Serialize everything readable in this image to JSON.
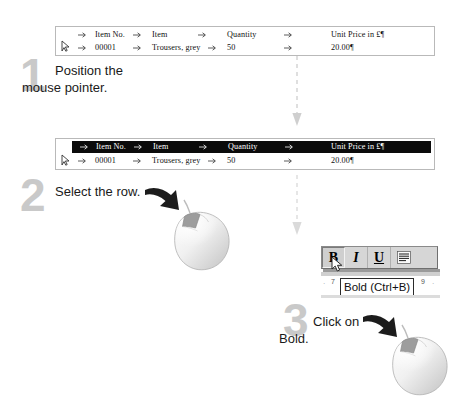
{
  "doc": {
    "title": "Bold a table row - three step instruction",
    "columns": [
      "Item No.",
      "Item",
      "Quantity",
      "Unit Price in £"
    ],
    "row_values": [
      "00001",
      "Trousers, grey",
      "50",
      "20.00"
    ],
    "pilcrow": "¶",
    "tab_icon": "tab-arrow-icon",
    "cursor_icon": "row-select-cursor-icon"
  },
  "steps": [
    {
      "number": "1",
      "text_line1": "Position the",
      "text_line2": "mouse pointer.",
      "state": "unselected"
    },
    {
      "number": "2",
      "text_line1": "Select the row.",
      "text_line2": "",
      "state": "header-row-selected"
    },
    {
      "number": "3",
      "text_line1": "Click on",
      "text_line2": "Bold.",
      "state": "click-bold"
    }
  ],
  "toolbar": {
    "bold_label": "B",
    "italic_label": "I",
    "underline_label": "U",
    "justify_label": "justify-icon",
    "bold_pressed": true
  },
  "tooltip": {
    "text": "Bold (Ctrl+B)"
  },
  "ruler": {
    "left_mark": "7",
    "right_mark": "9",
    "tick_left": "·",
    "tick_right": "·"
  },
  "connectors": [
    {
      "name": "step1-to-step2",
      "style": "dashed-down-arrow"
    },
    {
      "name": "step2-to-step3",
      "style": "dashed-down-arrow"
    }
  ],
  "mice": [
    {
      "name": "mouse-illustration-step2",
      "button_highlight": "left-button"
    },
    {
      "name": "mouse-illustration-step3",
      "button_highlight": "left-button"
    }
  ],
  "colors": {
    "step_number": "#c9c9c9",
    "selection": "#0b0b0b",
    "table_border": "#b9b9b9",
    "toolbar_face": "#d6d6d6",
    "text": "#1a1a1a",
    "connector": "#cfcfcf"
  }
}
